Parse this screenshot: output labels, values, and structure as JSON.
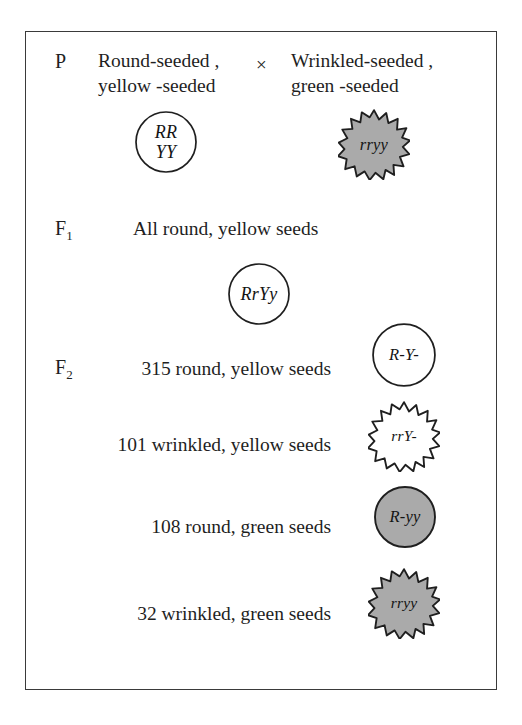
{
  "figure": {
    "border_color": "#3a3a3a",
    "background": "#ffffff",
    "round_fill_yellow": "#ffffff",
    "round_fill_green": "#aaaaaa",
    "outline_color": "#1f1f1f",
    "cross_symbol": "×"
  },
  "parental": {
    "label": "P",
    "parent1_text": "Round-seeded ,\nyellow -seeded",
    "parent1_genotype": "RR\nYY",
    "parent1_shape": "circle",
    "parent1_fill": "#ffffff",
    "parent2_text": "Wrinkled-seeded ,\ngreen -seeded",
    "parent2_genotype": "rryy",
    "parent2_shape": "starburst",
    "parent2_fill": "#aaaaaa"
  },
  "f1": {
    "label": "F",
    "label_subscript": "1",
    "phenotype_text": "All round, yellow seeds",
    "genotype": "RrYy",
    "shape": "circle",
    "fill": "#ffffff"
  },
  "f2": {
    "label": "F",
    "label_subscript": "2",
    "rows": [
      {
        "count": "315",
        "phenotype": "round, yellow seeds",
        "text": "315  round, yellow seeds",
        "genotype": "R-Y-",
        "shape": "circle",
        "fill": "#ffffff"
      },
      {
        "count": "101",
        "phenotype": "wrinkled, yellow seeds",
        "text": "101  wrinkled, yellow seeds",
        "genotype": "rrY-",
        "shape": "starburst",
        "fill": "#ffffff"
      },
      {
        "count": "108",
        "phenotype": "round, green seeds",
        "text": "108  round, green seeds",
        "genotype": "R-yy",
        "shape": "circle",
        "fill": "#aaaaaa"
      },
      {
        "count": "32",
        "phenotype": "wrinkled, green seeds",
        "text": "32  wrinkled, green seeds",
        "genotype": "rryy",
        "shape": "starburst",
        "fill": "#aaaaaa"
      }
    ]
  }
}
